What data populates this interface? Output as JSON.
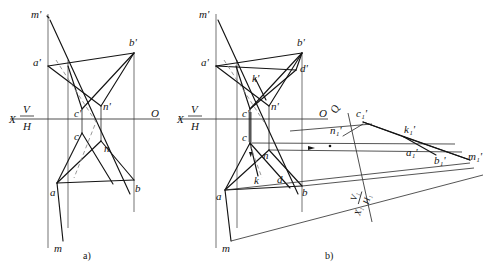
{
  "figure": {
    "captions": {
      "left": "a)",
      "right": "b)"
    },
    "colors": {
      "line": "#141414",
      "hidden": "#8c8c8c",
      "frame": "#5a5a5a",
      "axis": "#3a3a3a",
      "background": "#ffffff"
    }
  },
  "diagram_a": {
    "caption": "a)",
    "axis": {
      "x_label": "X",
      "v_label": "V",
      "h_label": "H",
      "o_label": "O"
    },
    "labels": {
      "m_prime": "m'",
      "a_prime": "a'",
      "b_prime": "b'",
      "c_prime": "c'",
      "n_prime": "n'",
      "c": "c",
      "n": "n",
      "a": "a",
      "b": "b",
      "m": "m"
    }
  },
  "diagram_b": {
    "caption": "b)",
    "axis": {
      "x_label": "X",
      "v_label": "V",
      "h_label": "H",
      "o_label": "O"
    },
    "aux_axis": {
      "x1_label": "X₁",
      "v1_label": "V₁",
      "h1_label": "H₁",
      "q_label": "Q"
    },
    "labels": {
      "m_prime": "m'",
      "a_prime": "a'",
      "b_prime": "b'",
      "d_prime": "d'",
      "k_prime": "k'",
      "c_prime": "c'",
      "n_prime": "n'",
      "c": "c",
      "n": "n",
      "k": "k",
      "d": "d",
      "a": "a",
      "b": "b",
      "m": "m"
    },
    "aux_labels": {
      "c1_prime": "c₁'",
      "k1_prime": "k₁'",
      "n1_prime": "n₁'",
      "a1_prime": "a₁'",
      "b1_prime": "b₁'",
      "m1_prime": "m₁'"
    }
  }
}
